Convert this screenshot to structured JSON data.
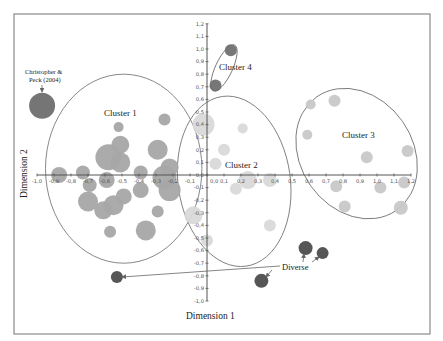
{
  "chart_data": {
    "type": "scatter",
    "subtype": "bubble",
    "title": "",
    "xlabel": "Dimension 1",
    "ylabel": "Dimension 2",
    "xlim": [
      -1.0,
      1.2
    ],
    "ylim": [
      -1.0,
      1.2
    ],
    "grid": false,
    "legend": null,
    "x_ticks": [
      "-1,0",
      "-0,9",
      "-0,8",
      "-0,7",
      "-0,6",
      "-0,5",
      "-0,4",
      "-0,3",
      "-0,2",
      "-0,1",
      "0,0",
      "0,1",
      "0,2",
      "0,3",
      "0,4",
      "0,5",
      "0,6",
      "0,7",
      "0,8",
      "0,9",
      "1,0",
      "1,1",
      "1,2"
    ],
    "y_ticks": [
      "-1,0",
      "-0,9",
      "-0,8",
      "-0,7",
      "-0,6",
      "-0,5",
      "-0,4",
      "-0,3",
      "-0,2",
      "-0,1",
      "0,0",
      "0,1",
      "0,2",
      "0,3",
      "0,4",
      "0,5",
      "0,6",
      "0,7",
      "0,8",
      "0,9",
      "1,0",
      "1,1",
      "1,2"
    ],
    "series": [
      {
        "name": "Cluster 1",
        "color": "#a6a6a6",
        "points": [
          {
            "x": -0.52,
            "y": 0.38,
            "r": 5
          },
          {
            "x": -0.25,
            "y": 0.44,
            "r": 6
          },
          {
            "x": -0.51,
            "y": 0.24,
            "r": 9
          },
          {
            "x": -0.58,
            "y": 0.14,
            "r": 13
          },
          {
            "x": -0.51,
            "y": 0.1,
            "r": 10
          },
          {
            "x": -0.29,
            "y": 0.2,
            "r": 10
          },
          {
            "x": -0.87,
            "y": 0.0,
            "r": 8
          },
          {
            "x": -0.73,
            "y": 0.02,
            "r": 7
          },
          {
            "x": -0.69,
            "y": -0.08,
            "r": 7
          },
          {
            "x": -0.59,
            "y": -0.04,
            "r": 8
          },
          {
            "x": -0.39,
            "y": 0.02,
            "r": 7
          },
          {
            "x": -0.39,
            "y": -0.12,
            "r": 8
          },
          {
            "x": -0.25,
            "y": -0.02,
            "r": 12
          },
          {
            "x": -0.22,
            "y": -0.12,
            "r": 11
          },
          {
            "x": -0.22,
            "y": 0.06,
            "r": 9
          },
          {
            "x": -0.7,
            "y": -0.21,
            "r": 10
          },
          {
            "x": -0.61,
            "y": -0.28,
            "r": 9
          },
          {
            "x": -0.55,
            "y": -0.24,
            "r": 10
          },
          {
            "x": -0.49,
            "y": -0.17,
            "r": 8
          },
          {
            "x": -0.29,
            "y": -0.29,
            "r": 6
          },
          {
            "x": -0.57,
            "y": -0.45,
            "r": 6
          },
          {
            "x": -0.36,
            "y": -0.44,
            "r": 10
          }
        ]
      },
      {
        "name": "Cluster 2",
        "color": "#d9d9d9",
        "points": [
          {
            "x": -0.02,
            "y": 0.4,
            "r": 11
          },
          {
            "x": 0.21,
            "y": 0.37,
            "r": 5
          },
          {
            "x": 0.1,
            "y": 0.2,
            "r": 6
          },
          {
            "x": 0.05,
            "y": 0.09,
            "r": 6
          },
          {
            "x": 0.24,
            "y": -0.04,
            "r": 9
          },
          {
            "x": 0.17,
            "y": -0.11,
            "r": 6
          },
          {
            "x": 0.37,
            "y": -0.04,
            "r": 7
          },
          {
            "x": 0.37,
            "y": -0.4,
            "r": 6
          },
          {
            "x": -0.08,
            "y": -0.32,
            "r": 9
          },
          {
            "x": 0.0,
            "y": -0.52,
            "r": 6
          }
        ]
      },
      {
        "name": "Cluster 3",
        "color": "#c8c8c8",
        "points": [
          {
            "x": 0.61,
            "y": 0.56,
            "r": 5
          },
          {
            "x": 0.75,
            "y": 0.59,
            "r": 6
          },
          {
            "x": 0.59,
            "y": 0.32,
            "r": 5
          },
          {
            "x": 0.94,
            "y": 0.14,
            "r": 6
          },
          {
            "x": 1.18,
            "y": 0.19,
            "r": 6
          },
          {
            "x": 0.76,
            "y": -0.09,
            "r": 6
          },
          {
            "x": 1.02,
            "y": -0.1,
            "r": 6
          },
          {
            "x": 1.16,
            "y": -0.06,
            "r": 6
          },
          {
            "x": 0.81,
            "y": -0.25,
            "r": 6
          },
          {
            "x": 1.14,
            "y": -0.26,
            "r": 7
          }
        ]
      },
      {
        "name": "Cluster 4",
        "color": "#707070",
        "points": [
          {
            "x": 0.14,
            "y": 0.99,
            "r": 6
          },
          {
            "x": 0.05,
            "y": 0.71,
            "r": 6
          }
        ]
      },
      {
        "name": "Christopher & Peck (2004)",
        "color": "#6e6e6e",
        "points": [
          {
            "x": -0.97,
            "y": 0.55,
            "r": 13
          }
        ]
      },
      {
        "name": "Diverse",
        "color": "#4d4d4d",
        "points": [
          {
            "x": 0.58,
            "y": -0.58,
            "r": 7
          },
          {
            "x": 0.68,
            "y": -0.62,
            "r": 6
          },
          {
            "x": 0.32,
            "y": -0.84,
            "r": 7
          },
          {
            "x": -0.53,
            "y": -0.81,
            "r": 6
          }
        ]
      }
    ],
    "ellipses": [
      {
        "name": "Cluster 1",
        "cx": -0.49,
        "cy": 0.05,
        "rx": 0.46,
        "ry": 0.75,
        "rot": 0
      },
      {
        "name": "Cluster 2",
        "cx": 0.16,
        "cy": -0.05,
        "rx": 0.33,
        "ry": 0.68,
        "rot": -8
      },
      {
        "name": "Cluster 3",
        "cx": 0.88,
        "cy": 0.17,
        "rx": 0.33,
        "ry": 0.55,
        "rot": -35
      },
      {
        "name": "Cluster 4",
        "cx": 0.1,
        "cy": 0.85,
        "rx": 0.05,
        "ry": 0.2,
        "rot": 25
      }
    ],
    "annotations": [
      {
        "text": "Cluster 1",
        "x": -0.52,
        "y": 0.63
      },
      {
        "text": "Cluster 2",
        "x": 0.22,
        "y": 0.07
      },
      {
        "text": "Cluster 3",
        "x": 0.84,
        "y": 0.33
      },
      {
        "text": "Cluster 4",
        "x": 0.11,
        "y": 0.88
      },
      {
        "text": "Christopher &",
        "x": -0.93,
        "y": 0.84
      },
      {
        "text": "Peck (2004)",
        "x": -0.93,
        "y": 0.76
      },
      {
        "text": "Diverse",
        "x": 0.53,
        "y": -0.72
      }
    ]
  },
  "axes": {
    "x_title": "Dimension 1",
    "y_title": "Dimension 2"
  },
  "labels": {
    "cluster1": "Cluster 1",
    "cluster2": "Cluster 2",
    "cluster3": "Cluster 3",
    "cluster4": "Cluster 4",
    "cp_line1": "Christopher  &",
    "cp_line2": "Peck (2004)",
    "diverse": "Diverse"
  }
}
